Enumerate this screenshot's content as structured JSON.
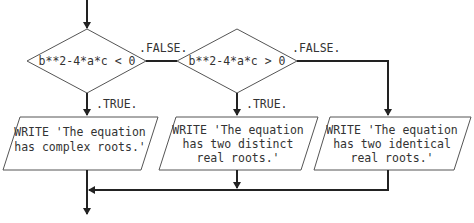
{
  "diagram": {
    "type": "flowchart",
    "decisions": [
      {
        "id": "d1",
        "condition": "b**2-4*a*c < 0",
        "true_label": ".TRUE.",
        "false_label": ".FALSE."
      },
      {
        "id": "d2",
        "condition": "b**2-4*a*c > 0",
        "true_label": ".TRUE.",
        "false_label": ".FALSE."
      }
    ],
    "outputs": [
      {
        "id": "o1",
        "lines": [
          "WRITE 'The equation",
          "has complex roots.'"
        ]
      },
      {
        "id": "o2",
        "lines": [
          "WRITE 'The equation",
          "has two distinct",
          "real roots.'"
        ]
      },
      {
        "id": "o3",
        "lines": [
          "WRITE 'The equation",
          "has two identical",
          "real roots.'"
        ]
      }
    ],
    "colors": {
      "stroke": "#555555",
      "flow": "#222222",
      "text": "#333333",
      "background": "#ffffff"
    }
  }
}
